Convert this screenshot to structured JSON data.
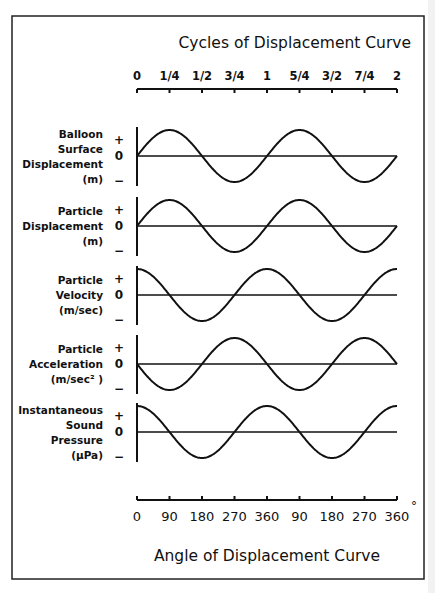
{
  "chart_data": {
    "type": "line",
    "title_top": "Cycles of Displacement Curve",
    "title_bottom": "Angle of Displacement Curve",
    "top_axis": {
      "label": "Cycles of Displacement Curve",
      "range": [
        0,
        2
      ],
      "ticks": [
        0,
        0.25,
        0.5,
        0.75,
        1,
        1.25,
        1.5,
        1.75,
        2
      ],
      "tick_labels": [
        "0",
        "1/4",
        "1/2",
        "3/4",
        "1",
        "5/4",
        "3/2",
        "7/4",
        "2"
      ]
    },
    "bottom_axis": {
      "label": "Angle of Displacement Curve",
      "range": [
        0,
        720
      ],
      "ticks": [
        0,
        90,
        180,
        270,
        360,
        450,
        540,
        630,
        720
      ],
      "tick_labels": [
        "0",
        "90",
        "180",
        "270",
        "360",
        "90",
        "180",
        "270",
        "360"
      ],
      "unit_symbol": "°"
    },
    "y_tick_labels": [
      "+",
      "0",
      "−"
    ],
    "series": [
      {
        "name": "Balloon Surface Displacement (m)",
        "label_lines": [
          "Balloon",
          "Surface",
          "Displacement",
          "(m)"
        ],
        "function": "sin",
        "phase_deg": 0,
        "cycles": 2
      },
      {
        "name": "Particle Displacement (m)",
        "label_lines": [
          "Particle",
          "Displacement",
          "(m)"
        ],
        "function": "sin",
        "phase_deg": 0,
        "cycles": 2
      },
      {
        "name": "Particle Velocity (m/sec)",
        "label_lines": [
          "Particle",
          "Velocity",
          "(m/sec)"
        ],
        "function": "cos",
        "phase_deg": 90,
        "cycles": 2
      },
      {
        "name": "Particle Acceleration (m/sec²)",
        "label_lines": [
          "Particle",
          "Acceleration",
          "(m/sec² )"
        ],
        "function": "-sin",
        "phase_deg": 180,
        "cycles": 2
      },
      {
        "name": "Instantaneous Sound Pressure (μPa)",
        "label_lines": [
          "Instantaneous",
          "Sound",
          "Pressure",
          "(μPa)"
        ],
        "function": "cos",
        "phase_deg": 90,
        "cycles": 2
      }
    ]
  }
}
